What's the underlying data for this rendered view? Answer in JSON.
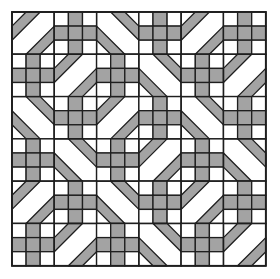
{
  "pattern": {
    "name": "Geometric quilt tiling",
    "origin": [
      12,
      12
    ],
    "block_size": 42.3,
    "rows": 6,
    "cols": 6,
    "colors": {
      "background": "#ffffff",
      "fill": "#a3a3a3",
      "line": "#1e1e1e"
    },
    "legend": {
      "P": "nine-patch plus block",
      "/": "diagonal block, bands cutting top-left and bottom-right corners",
      "\\": "diagonal block, bands cutting top-right and bottom-left corners"
    },
    "grid": [
      [
        "/",
        "P",
        "\\",
        "P",
        "/",
        "P"
      ],
      [
        "P",
        "/",
        "P",
        "\\",
        "P",
        "/"
      ],
      [
        "\\",
        "P",
        "/",
        "P",
        "\\",
        "P"
      ],
      [
        "P",
        "\\",
        "P",
        "/",
        "P",
        "\\"
      ],
      [
        "/",
        "P",
        "\\",
        "P",
        "/",
        "P"
      ],
      [
        "P",
        "/",
        "P",
        "\\",
        "P",
        "/"
      ]
    ]
  }
}
